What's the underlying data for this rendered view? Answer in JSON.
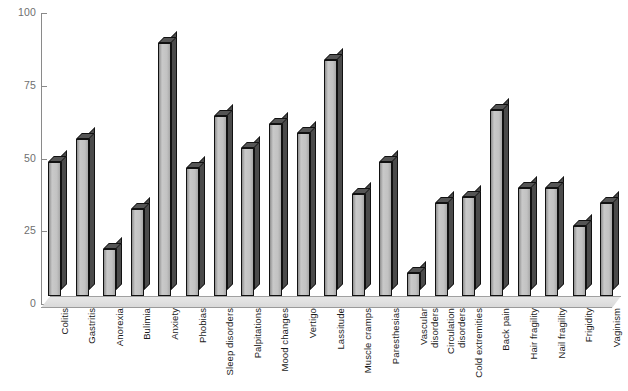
{
  "chart_data": {
    "type": "bar",
    "title": "",
    "subtitle": "",
    "xlabel": "",
    "ylabel": "",
    "ylim": [
      0,
      100
    ],
    "yticks": [
      0,
      25,
      50,
      75,
      100
    ],
    "grid": false,
    "legend": "none",
    "style": "3d-bar",
    "categories": [
      "Colitis",
      "Gastritis",
      "Anorexia",
      "Bulimia",
      "Anxiety",
      "Phobias",
      "Sleep disorders",
      "Palpitations",
      "Mood changes",
      "Vertigo",
      "Lassitude",
      "Muscle cramps",
      "Paresthesias",
      "Vascular\ndisorders",
      "Circulation\ndisorders",
      "Cold extremities",
      "Back pain",
      "Hair fragility",
      "Nail fragility",
      "Frigidity",
      "Vaginism"
    ],
    "values": [
      46,
      54,
      16,
      30,
      87,
      44,
      62,
      51,
      59,
      56,
      81,
      35,
      46,
      8,
      32,
      34,
      64,
      37,
      37,
      24,
      32
    ]
  },
  "colors": {
    "bar_face_light": "#c9c9c9",
    "bar_face_dark": "#8f8f8f",
    "bar_side": "#4b4b4b",
    "bar_outline": "#111111",
    "axis": "#8a8a8a",
    "tick_label": "#6f6f6f",
    "category_label": "#1a1a1a",
    "floor": "#e0e0e0",
    "background": "#ffffff"
  },
  "axis": {
    "y_tick_labels": [
      "100",
      "75",
      "50",
      "25",
      "0"
    ]
  }
}
